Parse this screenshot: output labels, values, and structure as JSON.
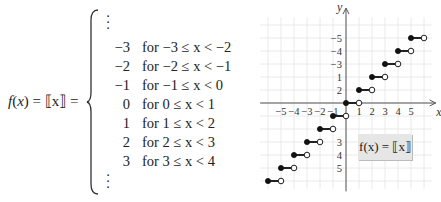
{
  "definition": {
    "lhs_name": "f",
    "lhs_var": "x",
    "lhs_eq": "= ⟦x⟧ =",
    "rows": [
      {
        "value": "−3",
        "condition": "for −3 ≤ x < −2"
      },
      {
        "value": "−2",
        "condition": "for −2 ≤ x < −1"
      },
      {
        "value": "−1",
        "condition": "for −1 ≤ x < 0"
      },
      {
        "value": "0",
        "condition": "for 0 ≤ x < 1"
      },
      {
        "value": "1",
        "condition": "for 1 ≤ x < 2"
      },
      {
        "value": "2",
        "condition": "for 2 ≤ x < 3"
      },
      {
        "value": "3",
        "condition": "for 3 ≤ x < 4"
      }
    ],
    "ellipsis": "⋮"
  },
  "graph": {
    "caption": "f(x) = ⟦x⟧",
    "x_axis_label": "x",
    "y_axis_label": "y",
    "x_ticks": [
      "−5",
      "−4",
      "−3",
      "−2",
      "−1",
      "1",
      "2",
      "3",
      "4",
      "5"
    ],
    "y_ticks": [
      "5",
      "4",
      "3",
      "2",
      "1",
      "−3",
      "−4",
      "−5"
    ]
  },
  "chart_data": {
    "type": "line",
    "xlabel": "x",
    "ylabel": "y",
    "xlim": [
      -6,
      6
    ],
    "ylim": [
      -6,
      6
    ],
    "grid": true,
    "x_tick_values": [
      -5,
      -4,
      -3,
      -2,
      -1,
      1,
      2,
      3,
      4,
      5
    ],
    "y_tick_values": [
      -5,
      -4,
      -3,
      1,
      2,
      3,
      4,
      5
    ],
    "segments": [
      {
        "x_start": -6,
        "x_end": -5,
        "y": -6,
        "start": "closed",
        "end": "open"
      },
      {
        "x_start": -5,
        "x_end": -4,
        "y": -5,
        "start": "closed",
        "end": "open"
      },
      {
        "x_start": -4,
        "x_end": -3,
        "y": -4,
        "start": "closed",
        "end": "open"
      },
      {
        "x_start": -3,
        "x_end": -2,
        "y": -3,
        "start": "closed",
        "end": "open"
      },
      {
        "x_start": -2,
        "x_end": -1,
        "y": -2,
        "start": "closed",
        "end": "open"
      },
      {
        "x_start": -1,
        "x_end": 0,
        "y": -1,
        "start": "closed",
        "end": "open"
      },
      {
        "x_start": 0,
        "x_end": 1,
        "y": 0,
        "start": "closed",
        "end": "open"
      },
      {
        "x_start": 1,
        "x_end": 2,
        "y": 1,
        "start": "closed",
        "end": "open"
      },
      {
        "x_start": 2,
        "x_end": 3,
        "y": 2,
        "start": "closed",
        "end": "open"
      },
      {
        "x_start": 3,
        "x_end": 4,
        "y": 3,
        "start": "closed",
        "end": "open"
      },
      {
        "x_start": 4,
        "x_end": 5,
        "y": 4,
        "start": "closed",
        "end": "open"
      },
      {
        "x_start": 5,
        "x_end": 6,
        "y": 5,
        "start": "closed",
        "end": "open"
      }
    ]
  }
}
